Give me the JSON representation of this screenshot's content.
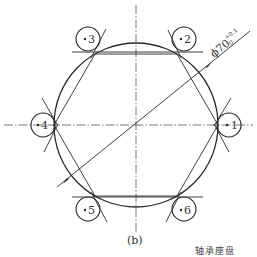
{
  "figure": {
    "caption": "(b)",
    "truncated_text": "轴承座盘",
    "dimension_label": "ϕ70",
    "dimension_tolerance_upper": "+0.1",
    "dimension_tolerance_lower": "0",
    "colors": {
      "line": "#2a2a2a",
      "center_line": "#555555",
      "background": "#ffffff"
    }
  },
  "points": [
    {
      "id": "1",
      "label": "1"
    },
    {
      "id": "2",
      "label": "2"
    },
    {
      "id": "3",
      "label": "3"
    },
    {
      "id": "4",
      "label": "4"
    },
    {
      "id": "5",
      "label": "5"
    },
    {
      "id": "6",
      "label": "6"
    }
  ]
}
